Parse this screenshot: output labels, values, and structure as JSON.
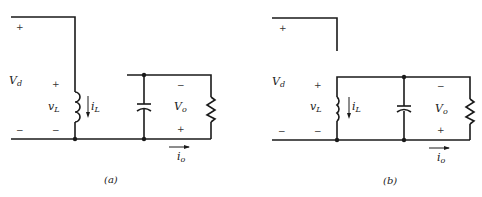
{
  "figure": {
    "panels": [
      {
        "id": "a",
        "label": "(a)",
        "source_voltage": {
          "symbol": "V",
          "sub": "d",
          "plus": "+",
          "minus": "−"
        },
        "inductor_voltage": {
          "symbol": "v",
          "sub": "L",
          "plus": "+",
          "minus": "−"
        },
        "inductor_current": {
          "symbol": "i",
          "sub": "L"
        },
        "output_voltage": {
          "symbol": "V",
          "sub": "o",
          "top_sign": "−",
          "bottom_sign": "+"
        },
        "output_current": {
          "symbol": "i",
          "sub": "o"
        }
      },
      {
        "id": "b",
        "label": "(b)",
        "source_voltage": {
          "symbol": "V",
          "sub": "d",
          "plus": "+",
          "minus": "−"
        },
        "inductor_voltage": {
          "symbol": "v",
          "sub": "L",
          "plus": "+",
          "minus": "−"
        },
        "inductor_current": {
          "symbol": "i",
          "sub": "L"
        },
        "output_voltage": {
          "symbol": "V",
          "sub": "o",
          "top_sign": "−",
          "bottom_sign": "+"
        },
        "output_current": {
          "symbol": "i",
          "sub": "o"
        }
      }
    ],
    "colors": {
      "wire": "#1a1a1a",
      "background": "#ffffff"
    }
  }
}
